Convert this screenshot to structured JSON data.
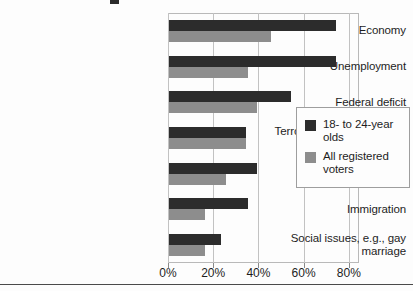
{
  "chart_data": {
    "type": "bar",
    "orientation": "horizontal",
    "title": "",
    "xlabel": "",
    "ylabel": "",
    "xlim": [
      0,
      85
    ],
    "grid": true,
    "legend_position": "right",
    "xticks": [
      "0%",
      "20%",
      "40%",
      "60%",
      "80%"
    ],
    "xtick_values": [
      0,
      20,
      40,
      60,
      80
    ],
    "categories": [
      "Economy",
      "Unemployment",
      "Federal deficit",
      "Terrorism/national security",
      "Income inequality",
      "Immigration",
      "Social issues, e.g., gay marriage"
    ],
    "series": [
      {
        "name": "18- to 24-year olds",
        "color": "#2c2c2c",
        "values": [
          74,
          74,
          54,
          34,
          39,
          35,
          23
        ]
      },
      {
        "name": "All registered voters",
        "color": "#8d8d8d",
        "values": [
          45,
          35,
          39,
          34,
          25,
          16,
          16
        ]
      }
    ]
  },
  "legend": {
    "items": [
      {
        "label": "18- to 24-year olds",
        "swatch": "dark"
      },
      {
        "label": "All registered voters",
        "swatch": "gray"
      }
    ]
  }
}
